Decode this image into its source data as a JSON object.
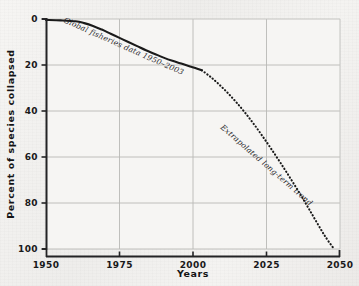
{
  "chart_data": {
    "type": "line",
    "title": "",
    "xlabel": "Years",
    "ylabel": "Percent of species collapsed",
    "xlim": [
      1950,
      2050
    ],
    "ylim": [
      0,
      100
    ],
    "y_axis_inverted": true,
    "grid": true,
    "legend_position": "none",
    "xticks": [
      1950,
      1975,
      2000,
      2025,
      2050
    ],
    "xtick_labels": [
      "1950",
      "1975",
      "2000",
      "2025",
      "2050"
    ],
    "yticks": [
      0,
      20,
      40,
      60,
      80,
      100
    ],
    "ytick_labels": [
      "0",
      "20",
      "40",
      "60",
      "80",
      "100"
    ],
    "series": [
      {
        "name": "Global fisheries data 1950-2003",
        "style": "solid",
        "color": "#1a1a1a",
        "x": [
          1950,
          1955,
          1960,
          1963,
          1966,
          1969,
          1972,
          1975,
          1978,
          1981,
          1984,
          1987,
          1990,
          1993,
          1996,
          1999,
          2001,
          2003
        ],
        "values": [
          0.4,
          0.6,
          1.0,
          1.8,
          3.0,
          4.6,
          6.4,
          8.2,
          10.0,
          11.8,
          13.6,
          15.2,
          16.8,
          18.2,
          19.4,
          20.6,
          21.4,
          22.3
        ]
      },
      {
        "name": "Extrapolated long-term trend",
        "style": "dotted",
        "color": "#1a1a1a",
        "x": [
          2003,
          2006,
          2009,
          2012,
          2015,
          2018,
          2021,
          2024,
          2027,
          2030,
          2033,
          2036,
          2039,
          2042,
          2045,
          2048
        ],
        "values": [
          22.3,
          25.2,
          28.6,
          32.4,
          36.6,
          41.2,
          46.2,
          51.6,
          57.2,
          63.0,
          69.0,
          75.2,
          81.6,
          88.2,
          94.6,
          100.0
        ]
      }
    ],
    "annotations": [
      {
        "id": "fisheries-data-label",
        "text": "Global fisheries data 1950–2003",
        "x": 63,
        "y": 22,
        "rotation": 24
      },
      {
        "id": "extrapolated-trend-label",
        "text": "Extrapolated long-term trend",
        "x": 220,
        "y": 128,
        "rotation": 41
      }
    ],
    "colors": {
      "background": "#f4f3f1",
      "plot_background": "#f6f5f3",
      "grid": "#b9b9b6",
      "axis": "#232325",
      "frame": "#c4c4c1",
      "curve": "#1a1a1a",
      "text": "#19191a"
    }
  }
}
